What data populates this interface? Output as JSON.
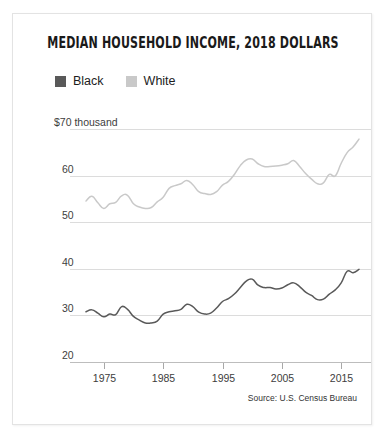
{
  "card": {
    "title": "MEDIAN HOUSEHOLD INCOME, 2018 DOLLARS",
    "source": "Source: U.S. Census Bureau"
  },
  "legend": {
    "items": [
      {
        "label": "Black",
        "color": "#595959"
      },
      {
        "label": "White",
        "color": "#c9c9c9"
      }
    ]
  },
  "chart_data": {
    "type": "line",
    "title": "MEDIAN HOUSEHOLD INCOME, 2018 DOLLARS",
    "subtitle": "",
    "xlabel": "",
    "ylabel": "$70 thousand",
    "xlim": [
      1972,
      2018
    ],
    "ylim": [
      20,
      72
    ],
    "grid": true,
    "legend_position": "top-left",
    "annotations": [
      "Source: U.S. Census Bureau"
    ],
    "ytick_labels": [
      "$70 thousand",
      "60",
      "50",
      "40",
      "30",
      "20"
    ],
    "yticks": [
      70,
      60,
      50,
      40,
      30,
      20
    ],
    "xticks": [
      1975,
      1985,
      1995,
      2005,
      2015
    ],
    "xtick_labels": [
      "1975",
      "1985",
      "1995",
      "2005",
      "2015"
    ],
    "x": [
      1972,
      1973,
      1974,
      1975,
      1976,
      1977,
      1978,
      1979,
      1980,
      1981,
      1982,
      1983,
      1984,
      1985,
      1986,
      1987,
      1988,
      1989,
      1990,
      1991,
      1992,
      1993,
      1994,
      1995,
      1996,
      1997,
      1998,
      1999,
      2000,
      2001,
      2002,
      2003,
      2004,
      2005,
      2006,
      2007,
      2008,
      2009,
      2010,
      2011,
      2012,
      2013,
      2014,
      2015,
      2016,
      2017,
      2018
    ],
    "series": [
      {
        "name": "White",
        "color": "#c9c9c9",
        "values": [
          54.6,
          55.6,
          54.2,
          53.0,
          54.0,
          54.3,
          55.7,
          55.8,
          54.0,
          53.3,
          53.0,
          53.2,
          54.4,
          55.4,
          57.3,
          57.9,
          58.3,
          59.0,
          58.1,
          56.6,
          56.2,
          56.0,
          56.6,
          58.0,
          58.8,
          60.3,
          62.2,
          63.4,
          63.6,
          62.6,
          62.0,
          62.0,
          62.1,
          62.3,
          62.6,
          63.3,
          62.0,
          60.5,
          59.3,
          58.3,
          58.5,
          60.3,
          60.0,
          62.7,
          65.0,
          66.2,
          67.9
        ]
      },
      {
        "name": "Black",
        "color": "#595959",
        "values": [
          30.8,
          31.2,
          30.5,
          29.7,
          30.3,
          30.2,
          31.9,
          31.3,
          29.8,
          29.0,
          28.4,
          28.4,
          28.8,
          30.3,
          30.8,
          31.0,
          31.3,
          32.4,
          31.9,
          30.7,
          30.3,
          30.5,
          31.6,
          33.0,
          33.6,
          34.6,
          36.0,
          37.4,
          37.8,
          36.5,
          36.0,
          36.0,
          35.7,
          35.9,
          36.6,
          37.0,
          36.2,
          35.0,
          34.3,
          33.4,
          33.5,
          34.6,
          35.5,
          37.0,
          39.5,
          39.2,
          39.9
        ]
      }
    ]
  }
}
